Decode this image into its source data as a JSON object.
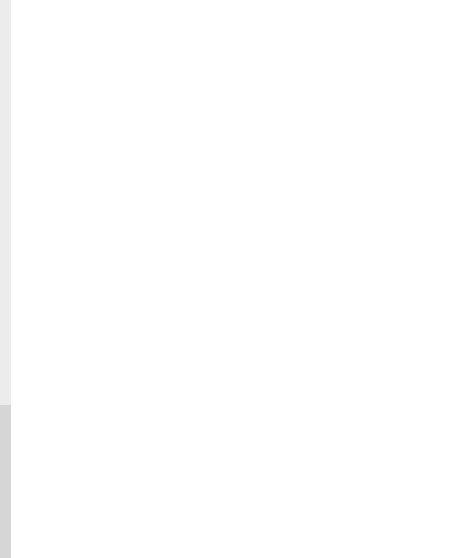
{
  "figure": {
    "stroke_color": "#2a2a2a",
    "background": "#ffffff",
    "side_strip_colors": [
      "#ececec",
      "#d6d6d6"
    ],
    "top_panel": {
      "frame": {
        "x": 21,
        "y": 22,
        "w": 428,
        "h": 325
      },
      "units": [
        {
          "box": {
            "x": 70,
            "y": 306,
            "w": 57,
            "h": 41
          },
          "triangle": {
            "apex": [
              128,
              100
            ],
            "left_foot": [
              98,
              306
            ],
            "right_foot": [
              162,
              347
            ]
          }
        },
        {
          "box": {
            "x": 178,
            "y": 306,
            "w": 59,
            "h": 41
          },
          "triangle": {
            "apex": [
              238,
              100
            ],
            "left_foot": [
              206,
              306
            ],
            "right_foot": [
              272,
              347
            ]
          }
        },
        {
          "box": {
            "x": 292,
            "y": 306,
            "w": 57,
            "h": 41
          },
          "triangle": {
            "apex": [
              351,
              100
            ],
            "left_foot": [
              320,
              306
            ],
            "right_foot": [
              384,
              347
            ]
          }
        }
      ]
    },
    "bottom_panel": {
      "frame": {
        "x": 21,
        "y": 365,
        "w": 428,
        "h": 190
      },
      "circles": [
        {
          "cx": 119,
          "cy": 430,
          "r": 23,
          "line": [
            97,
            441,
            141,
            419
          ],
          "dot": [
            121,
            412
          ]
        },
        {
          "cx": 236,
          "cy": 430,
          "r": 23,
          "line": [
            214,
            441,
            258,
            419
          ]
        },
        {
          "cx": 350,
          "cy": 430,
          "r": 23,
          "line": [
            328,
            441,
            372,
            419
          ]
        }
      ],
      "rects": [
        {
          "points": [
            [
              66,
              495
            ],
            [
              120,
              478
            ],
            [
              132,
              516
            ],
            [
              78,
              534
            ]
          ]
        },
        {
          "points": [
            [
              182,
              494
            ],
            [
              239,
              477
            ],
            [
              250,
              516
            ],
            [
              194,
              533
            ]
          ]
        },
        {
          "points": [
            [
              297,
              494
            ],
            [
              352,
              477
            ],
            [
              364,
              516
            ],
            [
              309,
              533
            ]
          ]
        }
      ]
    }
  }
}
